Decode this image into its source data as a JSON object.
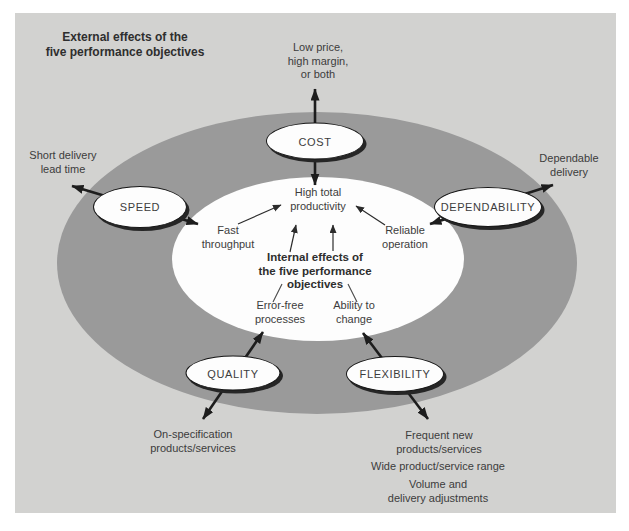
{
  "header": {
    "title": "External effects of the\nfive performance objectives"
  },
  "center": {
    "core_label": "High total\nproductivity",
    "internal_title": "Internal effects of\nthe five performance\nobjectives"
  },
  "objectives": [
    {
      "id": "cost",
      "label": "COST",
      "external": "Low price,\nhigh margin,\nor both",
      "internal": ""
    },
    {
      "id": "speed",
      "label": "SPEED",
      "external": "Short delivery\nlead time",
      "internal": "Fast\nthroughput"
    },
    {
      "id": "dependability",
      "label": "DEPENDABILITY",
      "external": "Dependable\ndelivery",
      "internal": "Reliable\noperation"
    },
    {
      "id": "quality",
      "label": "QUALITY",
      "external": "On-specification\nproducts/services",
      "internal": "Error-free\nprocesses"
    },
    {
      "id": "flexibility",
      "label": "FLEXIBILITY",
      "external": "Frequent new\nproducts/services",
      "internal": "Ability to\nchange",
      "external_extra": [
        "Wide product/service range",
        "Volume and\ndelivery adjustments"
      ]
    }
  ],
  "colors": {
    "box_bg": "#d2d2d0",
    "ring": "#9a9a9a",
    "inner": "#fdfdfd",
    "text": "#3c3c3c",
    "text_bold": "#2e2e2e",
    "arrow": "#1d1d1d"
  }
}
